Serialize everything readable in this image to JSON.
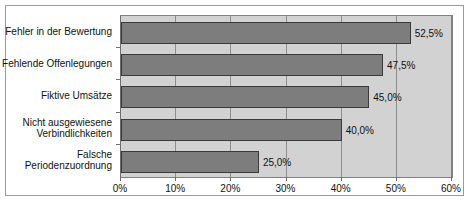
{
  "chart_data": {
    "type": "bar",
    "orientation": "horizontal",
    "title": "",
    "xlabel": "",
    "ylabel": "",
    "xlim": [
      0,
      60
    ],
    "grid": true,
    "legend": "none",
    "categories": [
      "Fehler in der Bewertung",
      "Fehlende Offenlegungen",
      "Fiktive Umsätze",
      "Nicht ausgewiesene\nVerbindlichkeiten",
      "Falsche\nPeriodenzuordnung"
    ],
    "values": [
      52.5,
      47.5,
      45.0,
      40.0,
      25.0
    ],
    "value_labels": [
      "52,5%",
      "47,5%",
      "45,0%",
      "40,0%",
      "25,0%"
    ],
    "xticks": [
      0,
      10,
      20,
      30,
      40,
      50,
      60
    ],
    "xtick_labels": [
      "0%",
      "10%",
      "20%",
      "30%",
      "40%",
      "50%",
      "60%"
    ],
    "colors": {
      "bar_fill": "#7d7d7d",
      "bar_border": "#3a3a3a",
      "plot_background": "#d2d2d2",
      "gridline": "#8d8d8d",
      "axis": "#6e6e6e",
      "frame_border": "#9a9a9a",
      "text": "#111111"
    }
  }
}
